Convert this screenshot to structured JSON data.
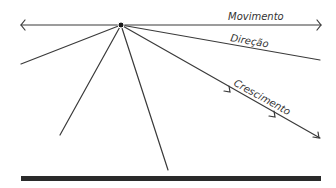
{
  "diagram": {
    "labels": {
      "movement": "Movimento",
      "direction": "Direção",
      "growth": "Crescimento"
    },
    "colors": {
      "line": "#3a3a3a",
      "bar": "#2a2a2a",
      "background": "#ffffff"
    }
  }
}
